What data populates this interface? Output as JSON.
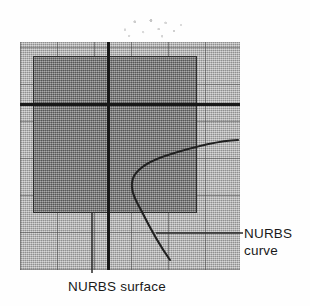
{
  "figure": {
    "name": "nurbs-surface-and-curve-diagram",
    "width": 310,
    "height": 306,
    "background": "#fefefe"
  },
  "annotations": {
    "curve": {
      "line1": "NURBS",
      "line2": "curve",
      "leader": "horizontal-leader-line"
    },
    "surface": {
      "text": "NURBS surface",
      "leader": "vertical-leader-line"
    }
  },
  "geometry": {
    "outer_plane": {
      "name": "nurbs-surface-outer-region",
      "color": "#b2b2b2",
      "x": 20,
      "y": 42,
      "width": 220,
      "height": 228
    },
    "inner_plane": {
      "name": "nurbs-surface-inner-patch",
      "color": "#7f7f7f",
      "border": "#2e2e2e",
      "x": 33,
      "y": 56,
      "width": 164,
      "height": 157
    },
    "grid": {
      "name": "isoparm-grid",
      "spacing": 37,
      "color": "#464646"
    },
    "axes": {
      "horizontal": {
        "y": 104,
        "color": "#181818"
      },
      "vertical": {
        "x": 108,
        "color": "#181818"
      }
    },
    "curve": {
      "name": "nurbs-curve-path",
      "color": "#202020",
      "start": [
        238,
        140
      ],
      "end": [
        170,
        260
      ],
      "bend": [
        133,
        176
      ]
    }
  },
  "colors": {
    "ink": "#1a1a1a",
    "light_gray": "#b2b2b2",
    "dark_gray": "#7f7f7f",
    "line": "#181818",
    "paper": "#fefefe"
  }
}
